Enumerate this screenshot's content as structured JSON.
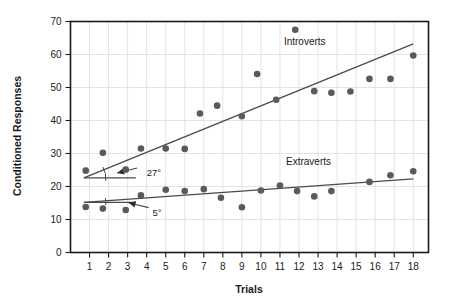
{
  "chart_data": {
    "type": "scatter",
    "title": "",
    "xlabel": "Trials",
    "ylabel": "Conditioned Responses",
    "xlim": [
      0,
      18.8
    ],
    "ylim": [
      0,
      70
    ],
    "grid": true,
    "legend_position": "inline-right",
    "xticks": [
      1,
      2,
      3,
      4,
      5,
      6,
      7,
      8,
      9,
      10,
      11,
      12,
      13,
      14,
      15,
      16,
      17,
      18
    ],
    "xtick_labels": [
      "1",
      "2",
      "3",
      "4",
      "5",
      "6",
      "7",
      "8",
      "9",
      "10",
      "11",
      "12",
      "13",
      "14",
      "15",
      "16",
      "17",
      "18"
    ],
    "yticks": [
      0,
      10,
      20,
      30,
      40,
      50,
      60,
      70
    ],
    "ytick_labels": [
      "0",
      "10",
      "20",
      "30",
      "40",
      "50",
      "60",
      "70"
    ],
    "series": [
      {
        "name": "Introverts",
        "color": "#5a5a5a",
        "x": [
          0.8,
          1.7,
          2.9,
          3.7,
          5.0,
          6.0,
          6.8,
          7.7,
          9.0,
          9.8,
          10.8,
          11.8,
          12.8,
          13.7,
          14.7,
          15.7,
          16.8,
          18.0
        ],
        "values": [
          24.8,
          30.2,
          25.1,
          31.5,
          31.5,
          31.4,
          42.1,
          44.5,
          41.3,
          54.1,
          46.3,
          67.5,
          48.9,
          48.4,
          48.8,
          52.6,
          52.6,
          59.7
        ],
        "trendline": {
          "x0": 0.7,
          "y0": 22.6,
          "x1": 18.0,
          "y1": 63.2,
          "angle_label": "27°"
        }
      },
      {
        "name": "Extraverts",
        "color": "#5a5a5a",
        "x": [
          0.8,
          1.7,
          2.9,
          3.7,
          5.0,
          6.0,
          7.0,
          7.9,
          9.0,
          10.0,
          11.0,
          11.9,
          12.8,
          13.7,
          15.7,
          16.8,
          18.0
        ],
        "values": [
          13.8,
          13.3,
          12.9,
          17.3,
          19.0,
          18.6,
          19.2,
          16.6,
          13.7,
          18.8,
          20.3,
          18.6,
          17.0,
          18.6,
          21.4,
          23.4,
          24.6
        ],
        "trendline": {
          "x0": 0.7,
          "y0": 15.2,
          "x1": 18.0,
          "y1": 22.3,
          "angle_label": "5°"
        }
      }
    ],
    "annotations": [
      {
        "name": "introverts-angle",
        "text": "27°",
        "x": 3.6,
        "y": 25.0
      },
      {
        "name": "extraverts-angle",
        "text": "5°",
        "x": 3.9,
        "y": 12.9
      }
    ]
  },
  "labels": {
    "y_axis_title": "Conditioned Responses",
    "x_axis_title": "Trials",
    "introverts": "Introverts",
    "extraverts": "Extraverts",
    "angle_introverts": "27°",
    "angle_extraverts": "5°"
  },
  "colors": {
    "point": "#5a5a5a",
    "trend": "#4a4a4a",
    "grid": "#d8d8d8",
    "frame": "#1a1a1a",
    "background": "#ffffff"
  }
}
